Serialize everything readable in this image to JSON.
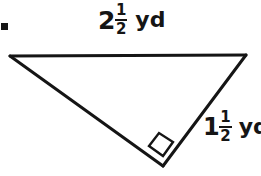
{
  "figure": {
    "type": "right-triangle-diagram",
    "stroke_color": "#151515",
    "background_color": "#ffffff",
    "bullet_marker": "square-bullet",
    "vertices": {
      "top_left": [
        10,
        56
      ],
      "top_right": [
        246,
        55
      ],
      "bottom": [
        163,
        166
      ]
    },
    "right_angle_at": "bottom",
    "right_angle_marker": "square-right-angle-icon"
  },
  "labels": {
    "top_side": {
      "whole": "2",
      "numerator": "1",
      "denominator": "2",
      "unit": "yd",
      "full_text": "2 1/2 yd"
    },
    "right_side": {
      "whole": "1",
      "numerator": "1",
      "denominator": "2",
      "unit": "yd",
      "full_text": "1 1/2 yd",
      "clipped": "yd"
    }
  }
}
